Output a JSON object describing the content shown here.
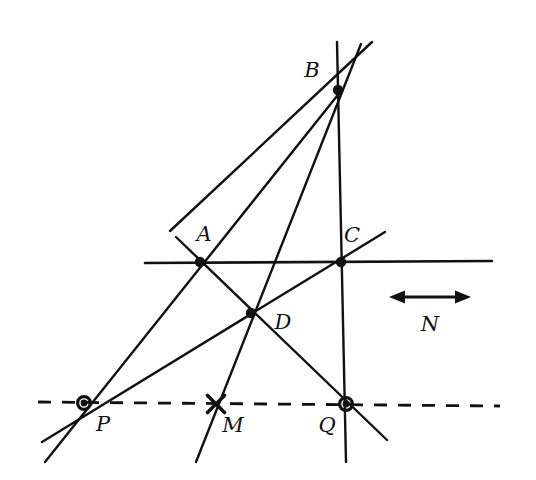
{
  "figure": {
    "kind": "euclidean-geometry-diagram",
    "title": "",
    "background_color": "#ffffff",
    "ink_color": "#111111",
    "width": 536,
    "height": 480
  },
  "points": [
    {
      "id": "A",
      "label": "A",
      "x": 200,
      "y": 262,
      "marker": "filled-dot",
      "label_x": 204,
      "label_y": 234
    },
    {
      "id": "B",
      "label": "B",
      "x": 338,
      "y": 90,
      "marker": "filled-dot",
      "label_x": 312,
      "label_y": 70
    },
    {
      "id": "C",
      "label": "C",
      "x": 341,
      "y": 262,
      "marker": "filled-dot",
      "label_x": 352,
      "label_y": 235
    },
    {
      "id": "D",
      "label": "D",
      "x": 251,
      "y": 313,
      "marker": "filled-dot",
      "label_x": 283,
      "label_y": 322
    },
    {
      "id": "P",
      "label": "P",
      "x": 84,
      "y": 403,
      "marker": "circled-dot",
      "label_x": 103,
      "label_y": 424
    },
    {
      "id": "M",
      "label": "M",
      "x": 216,
      "y": 404,
      "marker": "cross",
      "label_x": 233,
      "label_y": 425
    },
    {
      "id": "Q",
      "label": "Q",
      "x": 346,
      "y": 404,
      "marker": "circled-dot",
      "label_x": 327,
      "label_y": 425
    }
  ],
  "segments": [
    {
      "name": "line-m-horizontal",
      "style": "solid",
      "x1": 145,
      "y1": 263,
      "x2": 492,
      "y2": 261,
      "width": 2.6
    },
    {
      "name": "line-n-dashed",
      "style": "dashed",
      "x1": 38,
      "y1": 402,
      "x2": 500,
      "y2": 406,
      "width": 2.8,
      "dash": "13 11"
    },
    {
      "name": "line-through-A-and-B",
      "style": "solid",
      "x1": 170,
      "y1": 231,
      "x2": 372,
      "y2": 42,
      "width": 2.4
    },
    {
      "name": "line-through-B-and-D-to-M",
      "style": "solid",
      "x1": 196,
      "y1": 462,
      "x2": 361,
      "y2": 44,
      "width": 2.4
    },
    {
      "name": "line-B-to-C-to-Q",
      "style": "solid",
      "x1": 337,
      "y1": 42,
      "x2": 346,
      "y2": 462,
      "width": 2.4
    },
    {
      "name": "line-P-through-A-to-B",
      "style": "solid",
      "x1": 45,
      "y1": 462,
      "x2": 341,
      "y2": 91,
      "width": 2.4
    },
    {
      "name": "line-P-through-D-to-C",
      "style": "solid",
      "x1": 42,
      "y1": 442,
      "x2": 385,
      "y2": 232,
      "width": 2.4
    },
    {
      "name": "line-A-through-D-to-Q",
      "style": "solid",
      "x1": 176,
      "y1": 237,
      "x2": 387,
      "y2": 440,
      "width": 2.4
    }
  ],
  "direction_marker": {
    "name": "N",
    "label": "N",
    "label_x": 430,
    "label_y": 324,
    "arrow_y": 297,
    "arrow_x1": 389,
    "arrow_x2": 471,
    "arrow_width": 3.2,
    "head_length": 16,
    "head_half_width": 6.5
  },
  "marker_style": {
    "filled_dot_radius": 5.2,
    "circled_dot_outer_radius": 8.0,
    "circled_dot_ring_width": 3.2,
    "circled_dot_inner_radius": 3.4,
    "cross_arm": 8.5,
    "cross_width": 3.6
  }
}
